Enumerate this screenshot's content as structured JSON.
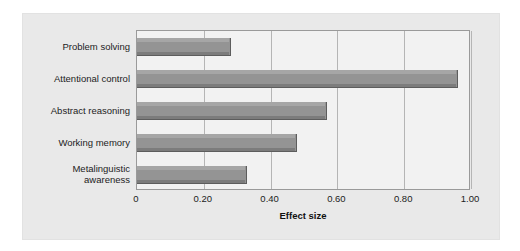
{
  "chart_data": {
    "type": "bar",
    "orientation": "horizontal",
    "title": "",
    "xlabel": "Effect size",
    "ylabel": "",
    "categories": [
      "Problem solving",
      "Attentional control",
      "Abstract reasoning",
      "Working memory",
      "Metalinguistic awareness"
    ],
    "category_lines": [
      [
        "Problem solving"
      ],
      [
        "Attentional control"
      ],
      [
        "Abstract reasoning"
      ],
      [
        "Working memory"
      ],
      [
        "Metalinguistic",
        "awareness"
      ]
    ],
    "values": [
      0.28,
      0.96,
      0.57,
      0.48,
      0.33
    ],
    "xlim": [
      0,
      1.0
    ],
    "xticks": [
      0,
      0.2,
      0.4,
      0.6,
      0.8,
      1.0
    ],
    "xtick_labels": [
      "0",
      "0.20",
      "0.40",
      "0.60",
      "0.80",
      "1.00"
    ],
    "grid": "vertical",
    "legend": "none",
    "colors": {
      "bar_fill": "#949494",
      "bar_highlight": "#a6a6a6",
      "bar_shadow": "#7c7c7c",
      "bar_edge": "#5d5d5d",
      "plot_background": "#f2f2f2",
      "panel_background": "#e9e9e9",
      "gridline": "#b5b5b5",
      "axis_line": "#9a9a9a",
      "text": "#1c1c1c",
      "page_background": "#ffffff"
    }
  }
}
